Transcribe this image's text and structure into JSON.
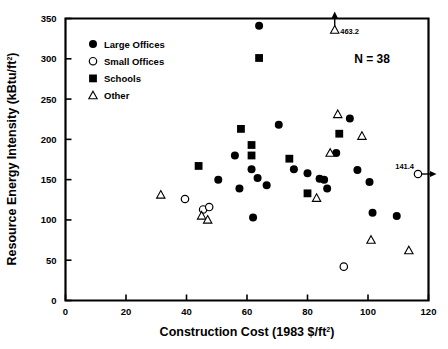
{
  "chart_data": {
    "type": "scatter",
    "title": "",
    "xlabel": "Construction Cost (1983 $/ft2)",
    "xlabel_main": "Construction Cost (1983 $/ft",
    "xlabel_sup": "2",
    "xlabel_tail": ")",
    "ylabel": "Resource Energy Intensity (kBtu/ft2)",
    "ylabel_main": "Resource Energy Intensity (kBtu/ft",
    "ylabel_sup": "2",
    "ylabel_tail": ")",
    "xlim": [
      0,
      120
    ],
    "ylim": [
      0,
      350
    ],
    "xticks": [
      0,
      20,
      40,
      60,
      80,
      100,
      120
    ],
    "yticks": [
      0,
      50,
      100,
      150,
      200,
      250,
      300,
      350
    ],
    "grid": false,
    "n_label": "N = 38",
    "legend_position": "upper-left-inside",
    "legend": [
      {
        "name": "Large Offices",
        "marker": "filled-circle"
      },
      {
        "name": "Small Offices",
        "marker": "open-circle"
      },
      {
        "name": "Schools",
        "marker": "filled-square"
      },
      {
        "name": "Other",
        "marker": "open-triangle"
      }
    ],
    "annotations": [
      {
        "text": "463.2",
        "x": 89,
        "y": 350,
        "marker": "open-triangle",
        "note": "off-scale above, arrow to top axis"
      },
      {
        "text": "141.4",
        "x": 120,
        "y": 157,
        "marker": "open-circle",
        "note": "off-scale right, arrow to right axis"
      }
    ],
    "series": [
      {
        "name": "Large Offices",
        "marker": "filled-circle",
        "points": [
          {
            "x": 64.0,
            "y": 341.0
          },
          {
            "x": 56.0,
            "y": 180.0
          },
          {
            "x": 57.5,
            "y": 139.0
          },
          {
            "x": 50.5,
            "y": 150.0
          },
          {
            "x": 61.5,
            "y": 163.0
          },
          {
            "x": 63.5,
            "y": 152.0
          },
          {
            "x": 66.5,
            "y": 143.0
          },
          {
            "x": 70.5,
            "y": 218.0
          },
          {
            "x": 62.0,
            "y": 103.0
          },
          {
            "x": 75.5,
            "y": 163.0
          },
          {
            "x": 80.0,
            "y": 158.0
          },
          {
            "x": 84.0,
            "y": 151.0
          },
          {
            "x": 85.5,
            "y": 150.0
          },
          {
            "x": 86.5,
            "y": 139.0
          },
          {
            "x": 89.5,
            "y": 183.0
          },
          {
            "x": 94.0,
            "y": 226.0
          },
          {
            "x": 96.5,
            "y": 162.0
          },
          {
            "x": 100.5,
            "y": 147.0
          },
          {
            "x": 101.5,
            "y": 109.0
          },
          {
            "x": 109.5,
            "y": 105.0
          }
        ]
      },
      {
        "name": "Small Offices",
        "marker": "open-circle",
        "points": [
          {
            "x": 39.5,
            "y": 126.0
          },
          {
            "x": 45.5,
            "y": 113.0
          },
          {
            "x": 47.5,
            "y": 116.0
          },
          {
            "x": 92.0,
            "y": 42.0
          }
        ]
      },
      {
        "name": "Schools",
        "marker": "filled-square",
        "points": [
          {
            "x": 64.0,
            "y": 301.0
          },
          {
            "x": 58.0,
            "y": 213.0
          },
          {
            "x": 61.5,
            "y": 193.0
          },
          {
            "x": 61.5,
            "y": 180.0
          },
          {
            "x": 74.0,
            "y": 176.0
          },
          {
            "x": 80.0,
            "y": 133.0
          },
          {
            "x": 90.5,
            "y": 207.0
          },
          {
            "x": 44.0,
            "y": 167.0
          }
        ]
      },
      {
        "name": "Other",
        "marker": "open-triangle",
        "points": [
          {
            "x": 31.5,
            "y": 131.0
          },
          {
            "x": 45.0,
            "y": 105.0
          },
          {
            "x": 47.0,
            "y": 100.0
          },
          {
            "x": 83.0,
            "y": 127.0
          },
          {
            "x": 87.5,
            "y": 183.0
          },
          {
            "x": 90.0,
            "y": 231.0
          },
          {
            "x": 98.0,
            "y": 204.0
          },
          {
            "x": 101.0,
            "y": 75.0
          },
          {
            "x": 113.5,
            "y": 62.0
          }
        ]
      }
    ]
  }
}
